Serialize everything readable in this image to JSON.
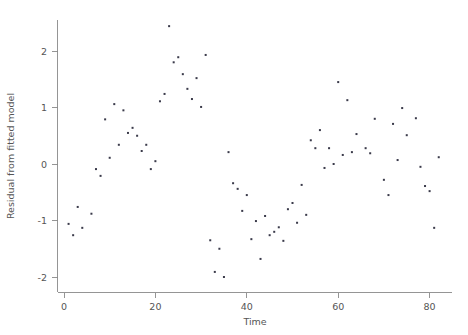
{
  "chart_data": {
    "type": "scatter",
    "title": "",
    "xlabel": "Time",
    "ylabel": "Residual from fitted model",
    "xlim": [
      -1,
      84
    ],
    "ylim": [
      -2.25,
      2.6
    ],
    "xticks": [
      0,
      20,
      40,
      60,
      80
    ],
    "xtick_labels": [
      "0",
      "20",
      "40",
      "60",
      "80"
    ],
    "yticks": [
      -2,
      -1,
      0,
      1,
      2
    ],
    "ytick_labels": [
      "-2",
      "-1",
      "0",
      "1",
      "2"
    ],
    "grid": false,
    "legend": null,
    "marker": "square",
    "marker_color": "#3a3a4a",
    "marker_size": 2.0,
    "axis_color": "#8a8a8a",
    "text_color": "#555555",
    "background": "#ffffff",
    "n_points": 82,
    "x": [
      1,
      2,
      3,
      4,
      6,
      7,
      8,
      9,
      10,
      11,
      12,
      13,
      14,
      15,
      16,
      17,
      18,
      19,
      20,
      21,
      22,
      23,
      24,
      25,
      26,
      27,
      28,
      29,
      30,
      31,
      32,
      33,
      34,
      35,
      36,
      37,
      38,
      39,
      40,
      41,
      42,
      43,
      44,
      45,
      46,
      47,
      48,
      49,
      50,
      51,
      52,
      53,
      54,
      55,
      56,
      57,
      58,
      59,
      60,
      61,
      62,
      63,
      64,
      66,
      67,
      68,
      70,
      71,
      72,
      73,
      74,
      75,
      77,
      78,
      79,
      80,
      81,
      82
    ],
    "y": [
      -1.06,
      -1.26,
      -0.76,
      -1.13,
      -0.88,
      -0.09,
      -0.21,
      0.79,
      0.11,
      1.06,
      0.34,
      0.95,
      0.55,
      0.64,
      0.5,
      0.23,
      0.34,
      -0.09,
      0.05,
      1.11,
      1.24,
      2.44,
      1.8,
      1.89,
      1.59,
      1.33,
      1.15,
      1.52,
      1.01,
      1.93,
      -1.35,
      -1.91,
      -1.5,
      -2.0,
      0.21,
      -0.34,
      -0.44,
      -0.83,
      -0.55,
      -1.33,
      -1.01,
      -1.68,
      -0.92,
      -1.26,
      -1.2,
      -1.12,
      -1.36,
      -0.8,
      -0.69,
      -1.04,
      -0.37,
      -0.9,
      0.42,
      0.28,
      0.6,
      -0.07,
      0.28,
      0.0,
      1.45,
      0.16,
      1.13,
      0.21,
      0.53,
      0.28,
      0.19,
      0.8,
      -0.28,
      -0.55,
      0.71,
      0.07,
      0.99,
      0.51,
      0.81,
      -0.05,
      -0.39,
      -0.48,
      -1.13,
      0.12
    ]
  },
  "axes": {
    "x_label": "Time",
    "y_label": "Residual from fitted model"
  }
}
